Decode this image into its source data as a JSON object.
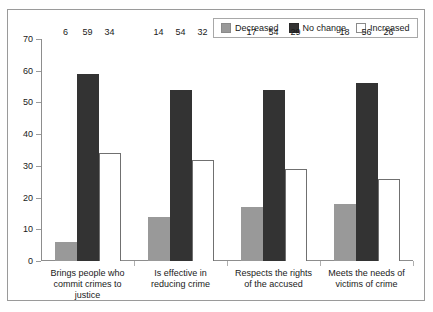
{
  "chart_data": {
    "type": "bar",
    "title": "",
    "xlabel": "",
    "ylabel": "",
    "ylim": [
      0,
      70
    ],
    "ytick_step": 10,
    "yticks": [
      70,
      60,
      50,
      40,
      30,
      20,
      10,
      0
    ],
    "grid": false,
    "legend_position": "top-right",
    "categories": [
      "Brings people who commit crimes to justice",
      "Is effective in reducing crime",
      "Respects the rights of the accused",
      "Meets the needs of victims of crime"
    ],
    "category_lines": [
      [
        "Brings people who",
        "commit crimes to",
        "justice"
      ],
      [
        "Is effective in",
        "reducing crime"
      ],
      [
        "Respects the rights",
        "of the accused"
      ],
      [
        "Meets the needs of",
        "victims of crime"
      ]
    ],
    "series": [
      {
        "name": "Decreased",
        "color": "#999999",
        "values": [
          6,
          14,
          17,
          18
        ]
      },
      {
        "name": "No change",
        "color": "#333333",
        "values": [
          59,
          54,
          54,
          56
        ]
      },
      {
        "name": "Increased",
        "color": "#ffffff",
        "values": [
          34,
          32,
          29,
          26
        ]
      }
    ]
  },
  "legend": {
    "entries": [
      {
        "label": "Decreased",
        "swatch": "legend-swatch-decreased"
      },
      {
        "label": "No change",
        "swatch": "legend-swatch-no-change"
      },
      {
        "label": "Increased",
        "swatch": "legend-swatch-increased"
      }
    ]
  }
}
